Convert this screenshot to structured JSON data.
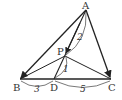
{
  "diagram": {
    "type": "geometry-triangle",
    "points": {
      "A": {
        "label": "A",
        "x": 86,
        "y": 10
      },
      "B": {
        "label": "B",
        "x": 20,
        "y": 79
      },
      "C": {
        "label": "C",
        "x": 111,
        "y": 79
      },
      "D": {
        "label": "D",
        "x": 54,
        "y": 79
      },
      "P": {
        "label": "P",
        "x": 65,
        "y": 56
      }
    },
    "segments": [
      {
        "from": "A",
        "to": "B",
        "arrow": true
      },
      {
        "from": "A",
        "to": "C",
        "arrow": true
      },
      {
        "from": "A",
        "to": "D",
        "arrow": false
      },
      {
        "from": "B",
        "to": "C",
        "arrow": false
      },
      {
        "from": "P",
        "to": "B",
        "arrow": false
      },
      {
        "from": "P",
        "to": "C",
        "arrow": false
      }
    ],
    "measurements": {
      "AP": "2",
      "PD": "1",
      "BD": "3",
      "DC": "5"
    },
    "colors": {
      "stroke": "#222222",
      "text": "#333333"
    }
  }
}
